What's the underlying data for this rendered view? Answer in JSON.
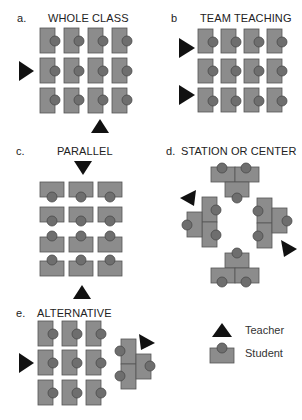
{
  "panels": {
    "a": {
      "letter": "a.",
      "title": "WHOLE CLASS"
    },
    "b": {
      "letter": "b",
      "title": "TEAM TEACHING"
    },
    "c": {
      "letter": "c.",
      "title": "PARALLEL"
    },
    "d": {
      "letter": "d.",
      "title": "STATION OR CENTER"
    },
    "e": {
      "letter": "e.",
      "title": "ALTERNATIVE"
    }
  },
  "legend": {
    "teacher": {
      "icon": "triangle-icon",
      "label": "Teacher"
    },
    "student": {
      "icon": "desk-with-circle-icon",
      "label": "Student"
    }
  },
  "colors": {
    "desk": "#8c8c8c",
    "student": "#6e6e6e",
    "teacher": "#111111",
    "background": "#ffffff"
  }
}
